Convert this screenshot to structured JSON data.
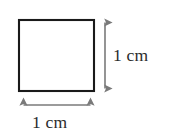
{
  "figure": {
    "kind": "geometry-diagram",
    "background_color": "#ffffff"
  },
  "shape": {
    "name": "square",
    "stroke_color": "#1a1a1a",
    "fill_color": "#ffffff",
    "stroke_width": 2,
    "x": 18,
    "y": 19,
    "width": 77,
    "height": 73
  },
  "dimensions": {
    "arrow_color": "#7a7a7a",
    "height": {
      "label": "1 cm",
      "value": 1,
      "unit": "cm",
      "orientation": "vertical",
      "arrow_x": 105,
      "arrow_y_start": 18,
      "arrow_y_end": 93
    },
    "width": {
      "label": "1 cm",
      "value": 1,
      "unit": "cm",
      "orientation": "horizontal",
      "arrow_y": 105,
      "arrow_x_start": 19,
      "arrow_x_end": 95
    }
  }
}
